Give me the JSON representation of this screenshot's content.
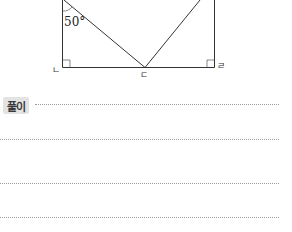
{
  "figure": {
    "angle_label": "50°",
    "vertices": {
      "bottom_left": "ㄴ",
      "bottom_mid": "ㄷ",
      "bottom_right": "ㄹ"
    },
    "shape": "rectangle with two segments from top corners meeting at bottom midpoint ㄷ; right angles at ㄴ and ㄹ"
  },
  "solution": {
    "label": "풀이",
    "line_count": 4
  }
}
